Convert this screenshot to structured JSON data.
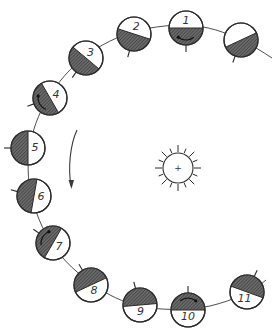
{
  "diagram": {
    "title": "",
    "colors": {
      "shade": "#5a5a5a",
      "line": "#2a2a2a",
      "background": "#ffffff"
    },
    "sun": {
      "label": "+",
      "cx": 178,
      "cy": 168,
      "r": 15,
      "ray_count": 16
    },
    "direction_arrow": {
      "orientation": "counter-clockwise",
      "label": ""
    },
    "bodies": [
      {
        "label": "",
        "cx": 241,
        "cy": 40,
        "shade_angle": 205,
        "tick_angle": 110
      },
      {
        "label": "1",
        "cx": 186,
        "cy": 28,
        "shade_angle": 180,
        "tick_angle": 90,
        "rotation_arrow": true
      },
      {
        "label": "2",
        "cx": 134,
        "cy": 34,
        "shade_angle": 162,
        "tick_angle": 105
      },
      {
        "label": "3",
        "cx": 86,
        "cy": 58,
        "shade_angle": 140,
        "tick_angle": 125
      },
      {
        "label": "4",
        "cx": 50,
        "cy": 98,
        "shade_angle": 120,
        "tick_angle": 160,
        "rotation_arrow": true
      },
      {
        "label": "5",
        "cx": 28,
        "cy": 148,
        "shade_angle": 90,
        "tick_angle": 180
      },
      {
        "label": "6",
        "cx": 34,
        "cy": 196,
        "shade_angle": 80,
        "tick_angle": 195
      },
      {
        "label": "7",
        "cx": 53,
        "cy": 243,
        "shade_angle": 60,
        "tick_angle": 215,
        "rotation_arrow": true
      },
      {
        "label": "8",
        "cx": 91,
        "cy": 285,
        "shade_angle": 25,
        "tick_angle": 240
      },
      {
        "label": "9",
        "cx": 140,
        "cy": 305,
        "shade_angle": 5,
        "tick_angle": 255
      },
      {
        "label": "10",
        "cx": 188,
        "cy": 310,
        "shade_angle": 0,
        "tick_angle": 270,
        "rotation_arrow": true
      },
      {
        "label": "11",
        "cx": 247,
        "cy": 292,
        "shade_angle": -20,
        "tick_angle": 295
      }
    ]
  }
}
